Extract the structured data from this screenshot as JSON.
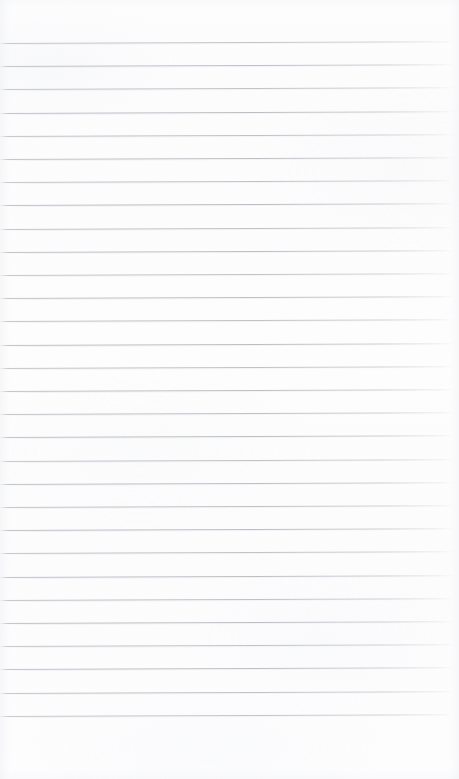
{
  "document": {
    "kind": "lined-paper-sheet",
    "title": "Blank ruled notebook page",
    "content_text": "",
    "written_text_present": false,
    "page_width_px": 459,
    "page_height_px": 779,
    "background_color": "#fdfdfd",
    "rule_color": "#b5b6be",
    "rule_thickness_px": 1,
    "rule_spacing_px": 23.2,
    "first_rule_y_px": 43,
    "last_rule_y_px": 716,
    "rule_count": 30,
    "top_margin_px": 43,
    "bottom_margin_px": 63,
    "left_margin_px": 0,
    "right_margin_px": 5,
    "slant_deg": -0.22,
    "margin_rule_present": false,
    "holes_present": false,
    "rules": [
      {
        "index": 1,
        "y": 43.0,
        "opacity": 0.86
      },
      {
        "index": 2,
        "y": 66.2,
        "opacity": 0.92
      },
      {
        "index": 3,
        "y": 89.4,
        "opacity": 0.88
      },
      {
        "index": 4,
        "y": 112.6,
        "opacity": 0.95
      },
      {
        "index": 5,
        "y": 135.8,
        "opacity": 0.9
      },
      {
        "index": 6,
        "y": 159.0,
        "opacity": 0.93
      },
      {
        "index": 7,
        "y": 182.2,
        "opacity": 0.89
      },
      {
        "index": 8,
        "y": 205.4,
        "opacity": 0.96
      },
      {
        "index": 9,
        "y": 228.6,
        "opacity": 0.9
      },
      {
        "index": 10,
        "y": 251.8,
        "opacity": 0.94
      },
      {
        "index": 11,
        "y": 275.0,
        "opacity": 0.88
      },
      {
        "index": 12,
        "y": 298.2,
        "opacity": 0.93
      },
      {
        "index": 13,
        "y": 321.4,
        "opacity": 0.9
      },
      {
        "index": 14,
        "y": 344.6,
        "opacity": 0.95
      },
      {
        "index": 15,
        "y": 367.8,
        "opacity": 0.89
      },
      {
        "index": 16,
        "y": 391.0,
        "opacity": 0.93
      },
      {
        "index": 17,
        "y": 414.2,
        "opacity": 0.91
      },
      {
        "index": 18,
        "y": 437.4,
        "opacity": 0.94
      },
      {
        "index": 19,
        "y": 460.6,
        "opacity": 0.88
      },
      {
        "index": 20,
        "y": 483.8,
        "opacity": 0.93
      },
      {
        "index": 21,
        "y": 507.0,
        "opacity": 0.9
      },
      {
        "index": 22,
        "y": 530.2,
        "opacity": 0.95
      },
      {
        "index": 23,
        "y": 553.4,
        "opacity": 0.89
      },
      {
        "index": 24,
        "y": 576.6,
        "opacity": 0.93
      },
      {
        "index": 25,
        "y": 599.8,
        "opacity": 0.91
      },
      {
        "index": 26,
        "y": 623.0,
        "opacity": 0.94
      },
      {
        "index": 27,
        "y": 646.2,
        "opacity": 0.88
      },
      {
        "index": 28,
        "y": 669.4,
        "opacity": 0.93
      },
      {
        "index": 29,
        "y": 692.6,
        "opacity": 0.9
      },
      {
        "index": 30,
        "y": 715.8,
        "opacity": 0.86
      }
    ]
  }
}
